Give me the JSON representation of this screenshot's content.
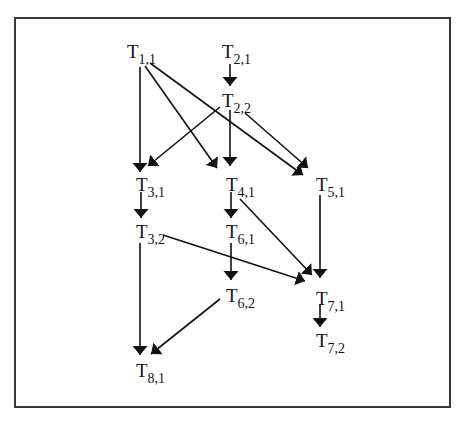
{
  "diagram": {
    "type": "task-dependency-graph",
    "nodes": [
      {
        "id": "T1_1",
        "base": "T",
        "sub": "1,1",
        "x": 127,
        "y": 58
      },
      {
        "id": "T2_1",
        "base": "T",
        "sub": "2,1",
        "x": 222,
        "y": 58
      },
      {
        "id": "T2_2",
        "base": "T",
        "sub": "2,2",
        "x": 222,
        "y": 107
      },
      {
        "id": "T3_1",
        "base": "T",
        "sub": "3,1",
        "x": 136,
        "y": 191
      },
      {
        "id": "T4_1",
        "base": "T",
        "sub": "4,1",
        "x": 226,
        "y": 191
      },
      {
        "id": "T5_1",
        "base": "T",
        "sub": "5,1",
        "x": 316,
        "y": 191
      },
      {
        "id": "T3_2",
        "base": "T",
        "sub": "3,2",
        "x": 136,
        "y": 238
      },
      {
        "id": "T6_1",
        "base": "T",
        "sub": "6,1",
        "x": 226,
        "y": 238
      },
      {
        "id": "T6_2",
        "base": "T",
        "sub": "6,2",
        "x": 226,
        "y": 302
      },
      {
        "id": "T7_1",
        "base": "T",
        "sub": "7,1",
        "x": 316,
        "y": 305
      },
      {
        "id": "T7_2",
        "base": "T",
        "sub": "7,2",
        "x": 316,
        "y": 347
      },
      {
        "id": "T8_1",
        "base": "T",
        "sub": "8,1",
        "x": 136,
        "y": 377
      }
    ],
    "edges": [
      {
        "from": "T1_1",
        "to": "T3_1",
        "x1": 140,
        "y1": 67,
        "x2": 140,
        "y2": 172
      },
      {
        "from": "T1_1",
        "to": "T4_1",
        "x1": 145,
        "y1": 66,
        "x2": 217,
        "y2": 168
      },
      {
        "from": "T1_1",
        "to": "T5_1",
        "x1": 150,
        "y1": 63,
        "x2": 303,
        "y2": 175
      },
      {
        "from": "T2_1",
        "to": "T2_2",
        "x1": 230,
        "y1": 64,
        "x2": 230,
        "y2": 86
      },
      {
        "from": "T2_2",
        "to": "T3_1",
        "x1": 220,
        "y1": 107,
        "x2": 148,
        "y2": 166
      },
      {
        "from": "T2_2",
        "to": "T4_1",
        "x1": 230,
        "y1": 110,
        "x2": 230,
        "y2": 166
      },
      {
        "from": "T2_2",
        "to": "T5_1",
        "x1": 245,
        "y1": 113,
        "x2": 308,
        "y2": 168
      },
      {
        "from": "T3_1",
        "to": "T3_2",
        "x1": 141,
        "y1": 192,
        "x2": 141,
        "y2": 218
      },
      {
        "from": "T4_1",
        "to": "T6_1",
        "x1": 231,
        "y1": 192,
        "x2": 231,
        "y2": 218
      },
      {
        "from": "T4_1",
        "to": "T7_1",
        "x1": 240,
        "y1": 199,
        "x2": 312,
        "y2": 275
      },
      {
        "from": "T5_1",
        "to": "T7_1",
        "x1": 320,
        "y1": 195,
        "x2": 320,
        "y2": 278
      },
      {
        "from": "T3_2",
        "to": "T7_1",
        "x1": 163,
        "y1": 235,
        "x2": 305,
        "y2": 281
      },
      {
        "from": "T6_1",
        "to": "T6_2",
        "x1": 231,
        "y1": 243,
        "x2": 231,
        "y2": 280
      },
      {
        "from": "T3_2",
        "to": "T8_1",
        "x1": 140,
        "y1": 243,
        "x2": 140,
        "y2": 355
      },
      {
        "from": "T6_2",
        "to": "T8_1",
        "x1": 220,
        "y1": 299,
        "x2": 151,
        "y2": 354
      },
      {
        "from": "T7_1",
        "to": "T7_2",
        "x1": 320,
        "y1": 304,
        "x2": 320,
        "y2": 327
      }
    ]
  }
}
